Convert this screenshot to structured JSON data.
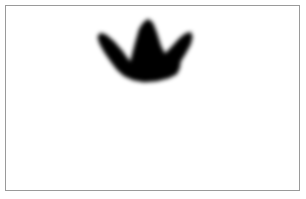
{
  "canvas": {
    "width": 306,
    "height": 199,
    "background_color": "#ffffff",
    "title": ""
  },
  "frame": {
    "name": "image-frame",
    "border_color": "#9a9a9a",
    "border_width": 1,
    "x": 5,
    "y": 5,
    "width": 295,
    "height": 186,
    "fill_color": "#ffffff"
  },
  "shapes": [
    {
      "name": "crown-blob",
      "kind": "silhouette",
      "description": "black blurred crown / bird-footprint shape",
      "color": "#050505",
      "blur": 2.2,
      "bbox": {
        "x": 92,
        "y": 13,
        "width": 59,
        "height": 42
      },
      "points": "39 45 44 26 48 12 52 6 57 2 62 6 66 16 70 29 74 37 80 31 88 22 94 17 100 15 102 20 100 28 95 37 90 45 89 52 86 58 78 62 66 65 53 66 42 64 33 60 26 54 20 46 13 36 8 27 6 20 9 16 15 18 23 25 31 34 36 41"
    }
  ],
  "labels": {
    "page_title": "",
    "status_text": ""
  }
}
